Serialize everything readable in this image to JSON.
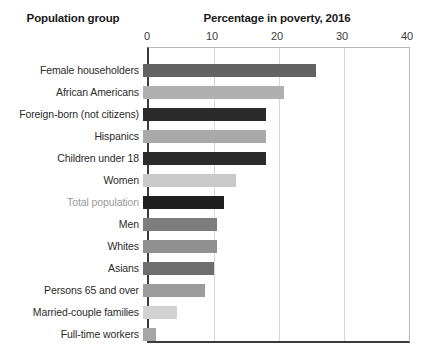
{
  "headers": {
    "group_header": "Population group",
    "value_header": "Percentage in poverty, 2016"
  },
  "chart_data": {
    "type": "bar",
    "orientation": "horizontal",
    "title": "Percentage in poverty, 2016",
    "xlabel": "Percentage in poverty, 2016",
    "ylabel": "Population group",
    "xlim": [
      0,
      40
    ],
    "xticks": [
      0,
      10,
      20,
      30,
      40
    ],
    "tick_labels": [
      "0",
      "10",
      "20",
      "30",
      "40"
    ],
    "grid": true,
    "legend": "none",
    "categories": [
      "Female householders",
      "African Americans",
      "Foreign-born (not citizens)",
      "Hispanics",
      "Children under 18",
      "Women",
      "Total population",
      "Men",
      "Whites",
      "Asians",
      "Persons 65 and over",
      "Married-couple families",
      "Full-time workers"
    ],
    "values": [
      26.6,
      21.7,
      18.9,
      18.9,
      18.9,
      14.3,
      12.5,
      11.4,
      11.4,
      10.9,
      9.5,
      5.2,
      2.0
    ],
    "bar_colors": [
      "#636363",
      "#b0b0b0",
      "#2b2b2b",
      "#a9a9a9",
      "#2b2b2b",
      "#c9c9c9",
      "#1f1f1f",
      "#7d7d7d",
      "#909090",
      "#6e6e6e",
      "#9c9c9c",
      "#d2d2d2",
      "#a6a6a6"
    ],
    "highlighted_category": "Total population",
    "highlight_label_color": "#9a9a9a"
  },
  "colors": {
    "axis_line": "#3b3b3b",
    "frame_line": "#b9b9b9",
    "gridline": "#d6d6d6",
    "text": "#2b2b2b",
    "background": "#ffffff"
  }
}
